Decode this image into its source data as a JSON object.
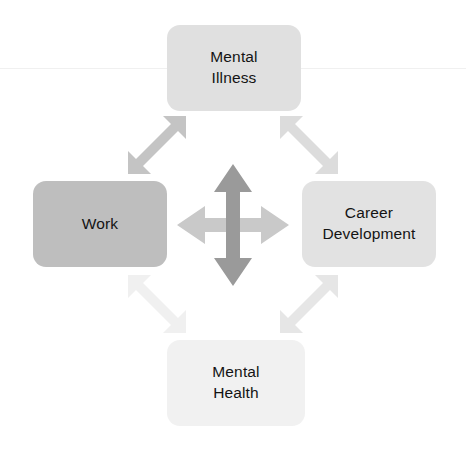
{
  "diagram": {
    "type": "bidirectional-relationship-diagram",
    "title": "",
    "background_color": "#ffffff",
    "nodes": [
      {
        "id": "mental-illness",
        "label": "Mental\nIllness",
        "position": "top",
        "fill": "#e0e0e0",
        "text_color": "#141414"
      },
      {
        "id": "work",
        "label": "Work",
        "position": "left",
        "fill": "#bebebe",
        "text_color": "#141414"
      },
      {
        "id": "career-development",
        "label": "Career\nDevelopment",
        "position": "right",
        "fill": "#e2e2e2",
        "text_color": "#141414"
      },
      {
        "id": "mental-health",
        "label": "Mental\nHealth",
        "position": "bottom",
        "fill": "#f1f1f1",
        "text_color": "#141414"
      }
    ],
    "connectors": [
      {
        "id": "work-to-mental-illness",
        "style": "double-headed-arrow",
        "orientation": "diagonal-up-right",
        "color": "#c4c4c4"
      },
      {
        "id": "mental-illness-to-career-development",
        "style": "double-headed-arrow",
        "orientation": "diagonal-down-right",
        "color": "#dcdcdc"
      },
      {
        "id": "work-to-mental-health",
        "style": "double-headed-arrow",
        "orientation": "diagonal-down-right",
        "color": "#f0f0f0"
      },
      {
        "id": "mental-health-to-career-development",
        "style": "double-headed-arrow",
        "orientation": "diagonal-up-right",
        "color": "#e6e6e6"
      },
      {
        "id": "center-vertical-arrow",
        "style": "double-headed-arrow",
        "orientation": "vertical",
        "color": "#9a9a9a"
      },
      {
        "id": "center-horizontal-arrow",
        "style": "double-headed-arrow",
        "orientation": "horizontal",
        "color": "#c9c9c9"
      }
    ]
  }
}
